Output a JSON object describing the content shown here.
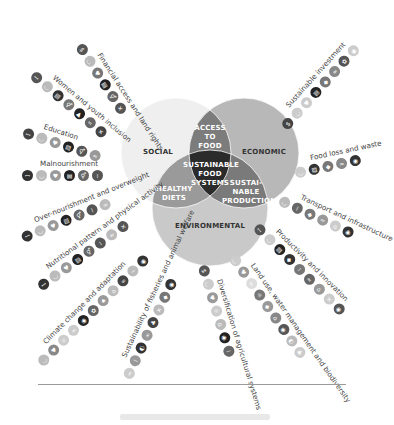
{
  "venn": {
    "social": "SOCIAL",
    "economic": "ECONOMIC",
    "environmental": "ENVIRONMENTAL",
    "access_to_food": [
      "ACCESS",
      "TO",
      "FOOD"
    ],
    "healthy_diets": [
      "HEALTHY",
      "DIETS"
    ],
    "sustainable_production": [
      "SUSTAI-",
      "NABLE",
      "PRODUCTION"
    ],
    "center": [
      "SUSTAINABLE",
      "FOOD",
      "SYSTEMS"
    ],
    "colors": {
      "social": "#efefef",
      "economic": "#b8b8b8",
      "environmental": "#c9c9c9",
      "access_overlap": "#7c7c7c",
      "healthy_overlap": "#9a9a9a",
      "production_overlap": "#7a7a7a",
      "center": "#2b2b2b"
    }
  },
  "chains": [
    {
      "label": "Financial access and land rights",
      "angle": 57,
      "x": 84,
      "y": 42,
      "icons": [
        "finance",
        "hunger",
        "health",
        "education",
        "gender",
        "partnership"
      ],
      "shades": [
        "#555",
        "#bbb",
        "#777",
        "#222",
        "#666",
        "#555"
      ]
    },
    {
      "label": "Women and youth inclusion",
      "angle": 40,
      "x": 36,
      "y": 70,
      "icons": [
        "poverty",
        "hunger",
        "education",
        "gender",
        "work",
        "inequality",
        "partnership"
      ],
      "shades": [
        "#555",
        "#bbb",
        "#333",
        "#777",
        "#222",
        "#666",
        "#444"
      ]
    },
    {
      "label": "Education",
      "angle": 18,
      "x": 25,
      "y": 127,
      "icons": [
        "poverty",
        "hunger",
        "health",
        "education",
        "gender",
        "water"
      ],
      "shades": [
        "#444",
        "#bbb",
        "#999",
        "#222",
        "#555",
        "#999"
      ]
    },
    {
      "label": "Malnourishment",
      "angle": 0,
      "x": 22,
      "y": 170,
      "icons": [
        "poverty",
        "hunger",
        "health",
        "education",
        "gender",
        "equality"
      ],
      "shades": [
        "#333",
        "#bbb",
        "#999",
        "#222",
        "#666",
        "#555"
      ]
    },
    {
      "label": "Over-nourishment and overweight",
      "angle": -22,
      "x": 20,
      "y": 233,
      "icons": [
        "poverty",
        "hunger",
        "health",
        "education",
        "gender",
        "equality",
        "consumption"
      ],
      "shades": [
        "#333",
        "#bbb",
        "#999",
        "#222",
        "#666",
        "#555",
        "#bbb"
      ]
    },
    {
      "label": "Nutritional pattern and physical activity",
      "angle": -36,
      "x": 36,
      "y": 283,
      "icons": [
        "poverty",
        "hunger",
        "health",
        "education",
        "gender",
        "equality",
        "consumption",
        "partnership"
      ],
      "shades": [
        "#333",
        "#bbb",
        "#999",
        "#222",
        "#666",
        "#555",
        "#bbb",
        "#555"
      ]
    },
    {
      "label": "Climate change and adaptation",
      "angle": -45,
      "x": 36,
      "y": 360,
      "icons": [
        "hunger",
        "health",
        "energy",
        "water",
        "climate",
        "ecosystems",
        "land",
        "cities",
        "consumption",
        "ocean",
        "climate-action"
      ],
      "shades": [
        "#bbb",
        "#888",
        "#ccc",
        "#ccc",
        "#222",
        "#666",
        "#999",
        "#bbb",
        "#444",
        "#bbb",
        "#333"
      ]
    },
    {
      "label": "Sustainability of fisheries and animal welfare",
      "angle": -65,
      "x": 122,
      "y": 376,
      "icons": [
        "water",
        "equality",
        "life-below",
        "consumption",
        "life-land",
        "partnership",
        "industry",
        "climate"
      ],
      "shades": [
        "#ccc",
        "#999",
        "#333",
        "#999",
        "#444",
        "#bbb",
        "#777",
        "#333"
      ]
    },
    {
      "label": "Diversification of agricultural systems",
      "angle": 73,
      "x": 208,
      "y": 264,
      "icons": [
        "finance",
        "hunger",
        "health",
        "energy",
        "cities",
        "climate",
        "equality"
      ],
      "shades": [
        "#555",
        "#ccc",
        "#999",
        "#ccc",
        "#bbb",
        "#222",
        "#666"
      ]
    },
    {
      "label": "Land use, water management and biodiversity",
      "angle": 55,
      "x": 237,
      "y": 253,
      "icons": [
        "hunger",
        "health",
        "water",
        "energy",
        "industry",
        "cities",
        "climate",
        "life-below",
        "life-land"
      ],
      "shades": [
        "#ccc",
        "#999",
        "#ddd",
        "#777",
        "#999",
        "#888",
        "#555",
        "#bbb",
        "#ccc"
      ]
    },
    {
      "label": "Productivity and innovation",
      "angle": 45,
      "x": 260,
      "y": 222,
      "icons": [
        "poverty",
        "hunger",
        "education",
        "industry",
        "equality",
        "water",
        "cities",
        "partnership",
        "climate"
      ],
      "shades": [
        "#555",
        "#ccc",
        "#222",
        "#333",
        "#777",
        "#666",
        "#999",
        "#ccc",
        "#555",
        "#333"
      ]
    },
    {
      "label": "Transport and infrastructure",
      "angle": 25,
      "x": 282,
      "y": 195,
      "icons": [
        "hunger",
        "equality",
        "industry",
        "water",
        "cities",
        "climate"
      ],
      "shades": [
        "#bbb",
        "#666",
        "#777",
        "#999",
        "#ccc",
        "#333"
      ]
    },
    {
      "label": "Food loss and waste",
      "angle": -12,
      "x": 294,
      "y": 168,
      "icons": [
        "hunger",
        "education",
        "industry",
        "water",
        "climate"
      ],
      "shades": [
        "#ccc",
        "#333",
        "#777",
        "#888",
        "#333"
      ]
    },
    {
      "label": "Sustainable investment",
      "angle": -48,
      "x": 280,
      "y": 124,
      "icons": [
        "finance",
        "hunger",
        "health",
        "education",
        "industry",
        "water",
        "ecosystems",
        "climate"
      ],
      "shades": [
        "#444",
        "#ccc",
        "#ccc",
        "#222",
        "#777",
        "#888",
        "#555",
        "#ccc"
      ]
    }
  ],
  "footer": {
    "rule_color": "#9a9a9a"
  }
}
